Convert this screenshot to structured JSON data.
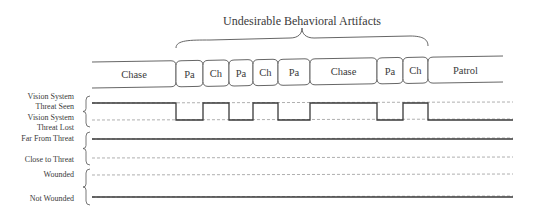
{
  "title": "Undesirable Behavioral Artifacts",
  "states": [
    {
      "label": "Chase",
      "kind": "start"
    },
    {
      "label": "Pa",
      "kind": "mid"
    },
    {
      "label": "Ch",
      "kind": "mid"
    },
    {
      "label": "Pa",
      "kind": "mid"
    },
    {
      "label": "Ch",
      "kind": "mid"
    },
    {
      "label": "Pa",
      "kind": "mid"
    },
    {
      "label": "Chase",
      "kind": "mid"
    },
    {
      "label": "Pa",
      "kind": "mid"
    },
    {
      "label": "Ch",
      "kind": "mid"
    },
    {
      "label": "Patrol",
      "kind": "end"
    }
  ],
  "signals": [
    {
      "name": "vision",
      "labels": {
        "high": [
          "Vision System",
          "Threat Seen"
        ],
        "low": [
          "Vision System",
          "Threat Lost"
        ]
      },
      "sequence": [
        "high",
        "low",
        "high",
        "low",
        "high",
        "low",
        "high",
        "low",
        "high",
        "low"
      ]
    },
    {
      "name": "distance",
      "labels": {
        "high": [
          "Far From Threat"
        ],
        "low": [
          "Close to Threat"
        ]
      },
      "sequence": [
        "high"
      ]
    },
    {
      "name": "health",
      "labels": {
        "high": [
          "Wounded"
        ],
        "low": [
          "Not Wounded"
        ]
      },
      "sequence": [
        "low"
      ]
    }
  ],
  "colors": {
    "line": "#3a3a3a",
    "dashed": "#9a9a9a",
    "text": "#3a3a3a"
  }
}
